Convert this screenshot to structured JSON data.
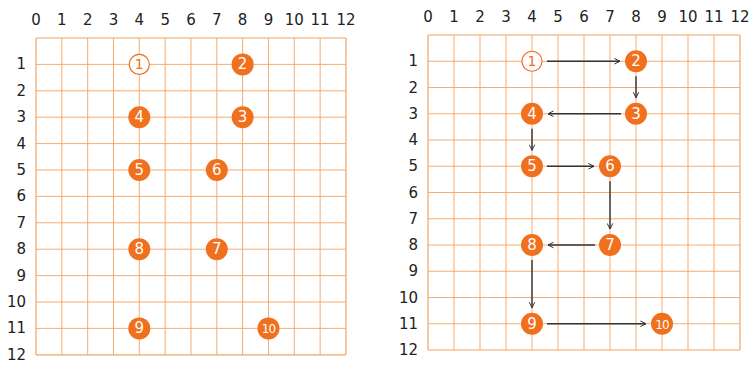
{
  "colors": {
    "grid_line": "#f2a463",
    "point_fill": "#f0701e",
    "point_text": "#ffffff",
    "start_stroke": "#f0701e",
    "arrow": "#333333",
    "axis_text": "#222222"
  },
  "axes": {
    "x_ticks": [
      "0",
      "1",
      "2",
      "3",
      "4",
      "5",
      "6",
      "7",
      "8",
      "9",
      "10",
      "11",
      "12"
    ],
    "y_ticks": [
      "1",
      "2",
      "3",
      "4",
      "5",
      "6",
      "7",
      "8",
      "9",
      "10",
      "11",
      "12"
    ]
  },
  "points": [
    {
      "label": "1",
      "x": 4,
      "y": 1,
      "style": "outline"
    },
    {
      "label": "2",
      "x": 8,
      "y": 1,
      "style": "filled"
    },
    {
      "label": "3",
      "x": 8,
      "y": 3,
      "style": "filled"
    },
    {
      "label": "4",
      "x": 4,
      "y": 3,
      "style": "filled"
    },
    {
      "label": "5",
      "x": 4,
      "y": 5,
      "style": "filled"
    },
    {
      "label": "6",
      "x": 7,
      "y": 5,
      "style": "filled"
    },
    {
      "label": "7",
      "x": 7,
      "y": 8,
      "style": "filled"
    },
    {
      "label": "8",
      "x": 4,
      "y": 8,
      "style": "filled"
    },
    {
      "label": "9",
      "x": 4,
      "y": 11,
      "style": "filled"
    },
    {
      "label": "10",
      "x": 9,
      "y": 11,
      "style": "filled"
    }
  ],
  "panels": [
    {
      "id": "left",
      "show_arrows": false,
      "x0": 36,
      "y0": 38,
      "cw": 25.83,
      "ch": 26.4
    },
    {
      "id": "right",
      "show_arrows": true,
      "x0": 428,
      "y0": 35,
      "cw": 26.0,
      "ch": 26.25
    }
  ]
}
